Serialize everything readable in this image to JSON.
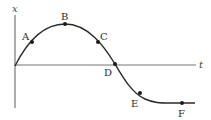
{
  "diagram": {
    "type": "position-time graph",
    "axes": {
      "vertical_label": "x",
      "horizontal_label": "t"
    },
    "points": [
      {
        "label": "A",
        "x": 32,
        "y": 42,
        "lx": 22,
        "ly": 40
      },
      {
        "label": "B",
        "x": 65,
        "y": 24,
        "lx": 61,
        "ly": 20
      },
      {
        "label": "C",
        "x": 98,
        "y": 42,
        "lx": 100,
        "ly": 40
      },
      {
        "label": "D",
        "x": 115,
        "y": 64,
        "lx": 104,
        "ly": 76
      },
      {
        "label": "E",
        "x": 140,
        "y": 93,
        "lx": 131,
        "ly": 107
      },
      {
        "label": "F",
        "x": 182,
        "y": 103,
        "lx": 178,
        "ly": 117
      }
    ],
    "colors": {
      "curve": "#2a2a2a",
      "axis": "#777777",
      "point": "#1a1a1a"
    }
  }
}
